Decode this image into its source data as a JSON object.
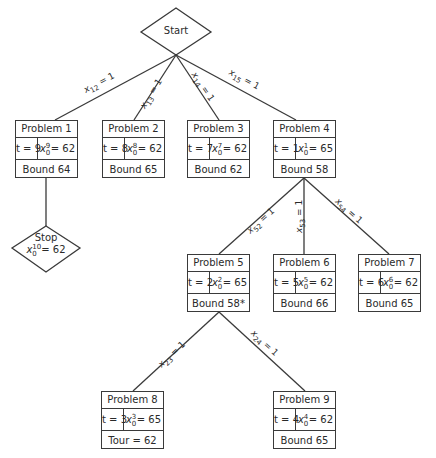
{
  "start": {
    "label": "Start"
  },
  "stop": {
    "label": "Stop",
    "var": "x",
    "sup": "10",
    "sub": "0",
    "eq": "= 62"
  },
  "edges": [
    {
      "id": "e-start-p1",
      "var": "x",
      "sub": "12",
      "value": "= 1"
    },
    {
      "id": "e-start-p2",
      "var": "x",
      "sub": "13",
      "value": "= 1"
    },
    {
      "id": "e-start-p3",
      "var": "x",
      "sub": "14",
      "value": "= 1"
    },
    {
      "id": "e-start-p4",
      "var": "x",
      "sub": "15",
      "value": "= 1"
    },
    {
      "id": "e-p4-p5",
      "var": "x",
      "sub": "52",
      "value": "= 1"
    },
    {
      "id": "e-p4-p6",
      "var": "x",
      "sub": "53",
      "value": "= 1"
    },
    {
      "id": "e-p4-p7",
      "var": "x",
      "sub": "54",
      "value": "= 1"
    },
    {
      "id": "e-p5-p8",
      "var": "x",
      "sub": "23",
      "value": "= 1"
    },
    {
      "id": "e-p5-p9",
      "var": "x",
      "sub": "24",
      "value": "= 1"
    }
  ],
  "problems": [
    {
      "title": "Problem 1",
      "t": "t = 9",
      "sup": "9",
      "sub": "0",
      "xval": "= 62",
      "footer": "Bound 64"
    },
    {
      "title": "Problem 2",
      "t": "t = 8",
      "sup": "8",
      "sub": "0",
      "xval": "= 62",
      "footer": "Bound 65"
    },
    {
      "title": "Problem 3",
      "t": "t = 7",
      "sup": "7",
      "sub": "0",
      "xval": "= 62",
      "footer": "Bound 62"
    },
    {
      "title": "Problem 4",
      "t": "t = 1",
      "sup": "1",
      "sub": "0",
      "xval": "= 65",
      "footer": "Bound 58"
    },
    {
      "title": "Problem 5",
      "t": "t = 2",
      "sup": "2",
      "sub": "0",
      "xval": "= 65",
      "footer": "Bound 58*"
    },
    {
      "title": "Problem 6",
      "t": "t = 5",
      "sup": "5",
      "sub": "0",
      "xval": "= 62",
      "footer": "Bound 66"
    },
    {
      "title": "Problem 7",
      "t": "t = 6",
      "sup": "6",
      "sub": "0",
      "xval": "= 62",
      "footer": "Bound 65"
    },
    {
      "title": "Problem 8",
      "t": "t = 3",
      "sup": "3",
      "sub": "0",
      "xval": "= 65",
      "footer": "Tour = 62"
    },
    {
      "title": "Problem 9",
      "t": "t = 4",
      "sup": "4",
      "sub": "0",
      "xval": "= 62",
      "footer": "Bound 65"
    }
  ],
  "colors": {
    "line": "#3a3a3a",
    "text": "#2a2a2a",
    "background": "#ffffff"
  }
}
